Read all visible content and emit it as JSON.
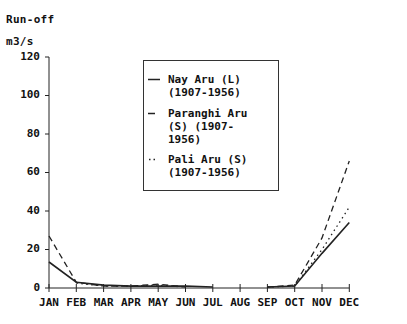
{
  "chart_data": {
    "type": "line",
    "title": "",
    "ylabel_line1": "Run-off",
    "ylabel_line2": "m3/s",
    "xlabel": "",
    "ylim": [
      0,
      120
    ],
    "yticks": [
      "0",
      "20",
      "40",
      "60",
      "80",
      "100",
      "120"
    ],
    "categories": [
      "JAN",
      "FEB",
      "MAR",
      "APR",
      "MAY",
      "JUN",
      "JUL",
      "AUG",
      "SEP",
      "OCT",
      "NOV",
      "DEC"
    ],
    "grid": false,
    "legend_position": "upper center (boxed)",
    "series": [
      {
        "name": "Nay Aru (L) (1907-1956)",
        "style": "solid",
        "values": [
          13.5,
          3,
          1.5,
          1,
          1,
          1,
          0.5,
          null,
          0.5,
          1,
          18,
          34
        ]
      },
      {
        "name": "Paranghi Aru (S) (1907-1956)",
        "style": "dashed",
        "values": [
          27,
          3,
          1,
          1,
          2,
          0.5,
          null,
          null,
          0.5,
          1.5,
          26,
          66
        ]
      },
      {
        "name": "Pali Aru (S) (1907-1956)",
        "style": "dotted",
        "values": [
          null,
          2.5,
          1,
          1,
          1.5,
          0.5,
          null,
          null,
          0.5,
          1,
          20,
          42
        ]
      }
    ]
  },
  "legend": {
    "items": [
      {
        "lines": [
          "Nay Aru (L)",
          "(1907-1956)"
        ]
      },
      {
        "lines": [
          "Paranghi Aru",
          "(S) (1907-",
          "1956)"
        ]
      },
      {
        "lines": [
          "Pali Aru (S)",
          "(1907-1956)"
        ]
      }
    ]
  }
}
